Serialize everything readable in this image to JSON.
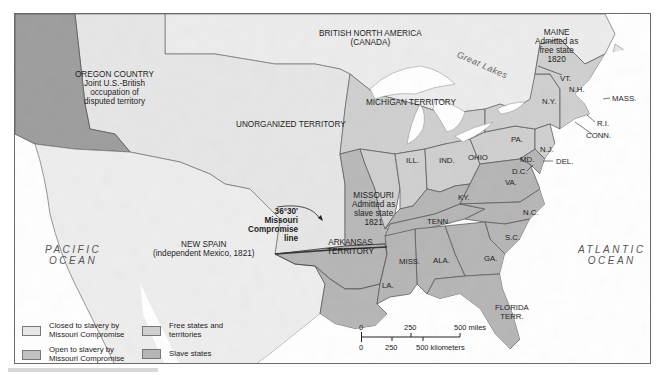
{
  "map": {
    "title": "The Missouri Compromise, 1820",
    "colors": {
      "ocean": "#ffffff",
      "closed_to_slavery": "#e6e6e6",
      "open_to_slavery": "#c2c2c2",
      "free_states": "#cfcfcf",
      "slave_states": "#b5b5b5",
      "oregon": "#9d9d9d",
      "foreign_land": "#eeeeee",
      "border": "#5a5a5a"
    },
    "regions": {
      "british_north_america": [
        "BRITISH NORTH AMERICA",
        "(CANADA)"
      ],
      "oregon_country": [
        "OREGON COUNTRY",
        "Joint U.S.-British",
        "occupation of",
        "disputed territory"
      ],
      "unorganized_territory": "UNORGANIZED TERRITORY",
      "michigan_territory": "MICHIGAN TERRITORY",
      "maine": [
        "MAINE",
        "Admitted as",
        "free state",
        "1820"
      ],
      "missouri": [
        "MISSOURI",
        "Admitted as",
        "slave state",
        "1821"
      ],
      "arkansas_territory": [
        "ARKANSAS",
        "TERRITORY"
      ],
      "new_spain": [
        "NEW SPAIN",
        "(independent Mexico, 1821)"
      ],
      "florida_territory": [
        "FLORIDA",
        "TERR."
      ],
      "compromise_line": [
        "36°30'",
        "Missouri",
        "Compromise",
        "line"
      ]
    },
    "states": {
      "vt": "VT.",
      "nh": "N.H.",
      "mass": "MASS.",
      "ri": "R.I.",
      "conn": "CONN.",
      "ny": "N.Y.",
      "pa": "PA.",
      "nj": "N.J.",
      "del": "DEL.",
      "md": "MD.",
      "dc": "D.C.",
      "va": "VA.",
      "nc": "N.C.",
      "sc": "S.C.",
      "ga": "GA.",
      "ala": "ALA.",
      "miss": "MISS.",
      "la": "LA.",
      "tenn": "TENN.",
      "ky": "KY.",
      "ohio": "OHIO",
      "ind": "IND.",
      "ill": "ILL."
    },
    "water": {
      "great_lakes": "Great Lakes",
      "pacific": [
        "PACIFIC",
        "OCEAN"
      ],
      "atlantic": [
        "ATLANTIC",
        "OCEAN"
      ]
    },
    "legend": [
      {
        "label": [
          "Closed to slavery by",
          "Missouri Compromise"
        ],
        "color": "#e6e6e6"
      },
      {
        "label": [
          "Open to slavery by",
          "Missouri Compromise"
        ],
        "color": "#c2c2c2"
      },
      {
        "label": [
          "Free states and",
          "territories"
        ],
        "color": "#cfcfcf"
      },
      {
        "label": [
          "Slave states"
        ],
        "color": "#b5b5b5"
      }
    ],
    "scale": {
      "miles": [
        "0",
        "250",
        "500 miles"
      ],
      "kilometers": [
        "0",
        "250",
        "500 kilometers"
      ]
    }
  }
}
